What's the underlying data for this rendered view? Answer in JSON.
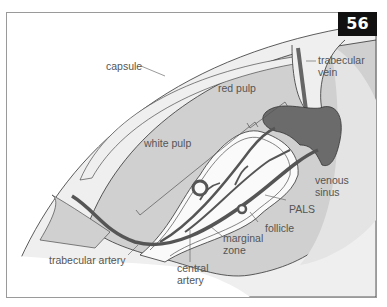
{
  "figure": {
    "number": "56",
    "labels": {
      "capsule": "capsule",
      "trabecular_vein_1": "trabecular",
      "trabecular_vein_2": "vein",
      "red_pulp": "red pulp",
      "white_pulp": "white pulp",
      "venous_sinus_1": "venous",
      "venous_sinus_2": "sinus",
      "pals": "PALS",
      "follicle": "follicle",
      "marginal_zone_1": "marginal",
      "marginal_zone_2": "zone",
      "trabecular_artery": "trabecular artery",
      "central_artery_1": "central",
      "central_artery_2": "artery"
    },
    "colors": {
      "capsule_fill": "#f0f0f0",
      "pulp_fill": "#cfcfcf",
      "vessel": "#555555",
      "vein_fill": "#6b6b6b",
      "outline": "#333333",
      "badge_bg": "#111111"
    }
  }
}
